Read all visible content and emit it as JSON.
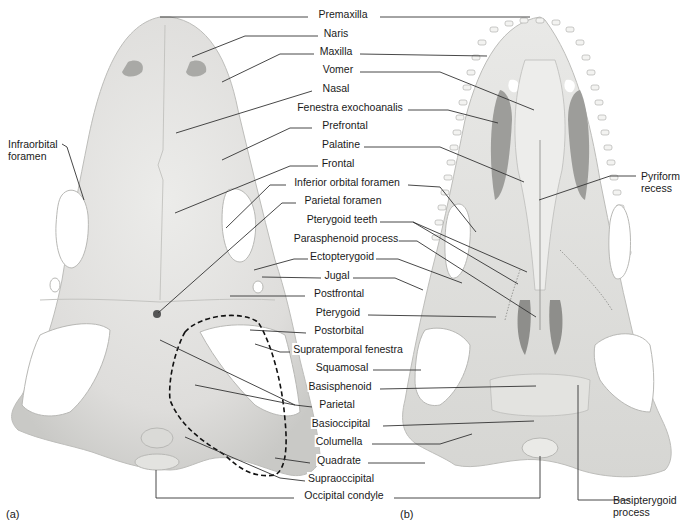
{
  "figure": {
    "panels": [
      {
        "id": "a",
        "label": "(a)",
        "view": "dorsal skull"
      },
      {
        "id": "b",
        "label": "(b)",
        "view": "ventral skull (palate)"
      }
    ],
    "colors": {
      "bone": "#e6e6e4",
      "bone_shade": "#cfcfcc",
      "bone_dark": "#b4b4b1",
      "leader_line": "#333333",
      "text": "#1a1a1a",
      "background": "#ffffff"
    }
  },
  "labels": {
    "center": [
      {
        "text": "Premaxilla",
        "x": 343,
        "y": 13
      },
      {
        "text": "Naris",
        "x": 336,
        "y": 32
      },
      {
        "text": "Maxilla",
        "x": 336,
        "y": 50
      },
      {
        "text": "Vomer",
        "x": 338,
        "y": 68
      },
      {
        "text": "Nasal",
        "x": 336,
        "y": 87
      },
      {
        "text": "Fenestra exochoanalis",
        "x": 350,
        "y": 106
      },
      {
        "text": "Prefrontal",
        "x": 345,
        "y": 124
      },
      {
        "text": "Palatine",
        "x": 341,
        "y": 143
      },
      {
        "text": "Frontal",
        "x": 338,
        "y": 162
      },
      {
        "text": "Inferior orbital foramen",
        "x": 347,
        "y": 181
      },
      {
        "text": "Parietal foramen",
        "x": 343,
        "y": 199
      },
      {
        "text": "Pterygoid teeth",
        "x": 342,
        "y": 218
      },
      {
        "text": "Parasphenoid process",
        "x": 346,
        "y": 237
      },
      {
        "text": "Ectopterygoid",
        "x": 342,
        "y": 255
      },
      {
        "text": "Jugal",
        "x": 337,
        "y": 274
      },
      {
        "text": "Postfrontal",
        "x": 339,
        "y": 292
      },
      {
        "text": "Pterygoid",
        "x": 338,
        "y": 311
      },
      {
        "text": "Postorbital",
        "x": 339,
        "y": 329
      },
      {
        "text": "Supratemporal fenestra",
        "x": 348,
        "y": 348
      },
      {
        "text": "Squamosal",
        "x": 342,
        "y": 366
      },
      {
        "text": "Basisphenoid",
        "x": 340,
        "y": 385
      },
      {
        "text": "Parietal",
        "x": 337,
        "y": 403
      },
      {
        "text": "Basioccipital",
        "x": 341,
        "y": 422
      },
      {
        "text": "Columella",
        "x": 339,
        "y": 440
      },
      {
        "text": "Quadrate",
        "x": 339,
        "y": 459
      },
      {
        "text": "Supraoccipital",
        "x": 341,
        "y": 477
      },
      {
        "text": "Occipital condyle",
        "x": 344,
        "y": 494
      }
    ],
    "side": [
      {
        "text": "Infraorbital\nforamen",
        "x": 7,
        "y": 142
      },
      {
        "text": "Pyriform\nrecess",
        "x": 641,
        "y": 172
      },
      {
        "text": "Basipterygoid\nprocess",
        "x": 638,
        "y": 494
      }
    ]
  },
  "annotations": {
    "dashed_outline": "Supratemporal fenestra region (dashed)"
  }
}
